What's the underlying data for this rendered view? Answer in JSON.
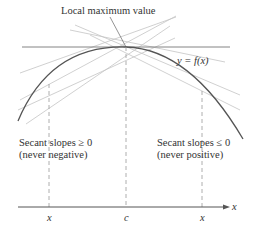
{
  "title_label": "Local maximum value",
  "curve_label": "y = f(x)",
  "left_note": {
    "line1": "Secant slopes ≥ 0",
    "line2": "(never negative)"
  },
  "right_note": {
    "line1": "Secant slopes ≤ 0",
    "line2": "(never positive)"
  },
  "axis": {
    "x_label": "x",
    "ticks": [
      "x",
      "c",
      "x"
    ]
  },
  "colors": {
    "curve": "#555555",
    "tangent": "#777777",
    "secant": "#bbbbbb",
    "text": "#333333"
  }
}
